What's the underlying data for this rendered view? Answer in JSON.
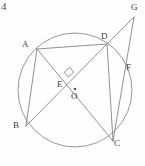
{
  "figure": {
    "number_label": "4",
    "caption": "",
    "stroke_color": "#777777",
    "label_color": "#3a3a3a",
    "background_color": "#fefefe"
  },
  "diagram": {
    "type": "circle-geometry",
    "circle": {
      "name": "circumscribed-circle",
      "center_label": "O",
      "center": {
        "x": 75,
        "y": 90
      },
      "radius": 57
    },
    "points": [
      {
        "id": "A",
        "label": "A",
        "x": 37,
        "y": 49,
        "on_circle": true
      },
      {
        "id": "B",
        "label": "B",
        "x": 26,
        "y": 126,
        "on_circle": true
      },
      {
        "id": "C",
        "label": "C",
        "x": 113,
        "y": 141,
        "on_circle": true
      },
      {
        "id": "D",
        "label": "D",
        "x": 107,
        "y": 44,
        "on_circle": true
      },
      {
        "id": "E",
        "label": "E",
        "x": 68,
        "y": 78,
        "on_circle": false
      },
      {
        "id": "F",
        "label": "F",
        "x": 125,
        "y": 71,
        "on_circle": true
      },
      {
        "id": "G",
        "label": "G",
        "x": 134,
        "y": 17,
        "on_circle": false
      },
      {
        "id": "O",
        "label": "O",
        "x": 75,
        "y": 89,
        "on_circle": false
      }
    ],
    "segments": [
      {
        "id": "AB",
        "from": "A",
        "to": "B",
        "name": "chord-ab"
      },
      {
        "id": "AD",
        "from": "A",
        "to": "D",
        "name": "chord-ad"
      },
      {
        "id": "AC",
        "from": "A",
        "to": "C",
        "name": "diagonal-ac"
      },
      {
        "id": "BD",
        "from": "B",
        "to": "D",
        "name": "diagonal-bd"
      },
      {
        "id": "BC",
        "from": "B",
        "to": "C",
        "name": "arc-side-bc"
      },
      {
        "id": "DC",
        "from": "D",
        "to": "C",
        "name": "chord-dc"
      },
      {
        "id": "DG",
        "from": "D",
        "to": "G",
        "name": "tangent-segment-dg"
      },
      {
        "id": "GC",
        "from": "G",
        "to": "C",
        "name": "secant-gc-through-f"
      }
    ],
    "right_angle": {
      "at": "E",
      "name": "right-angle-marker-at-e",
      "between": [
        "AC",
        "BD"
      ],
      "size": 8
    },
    "center_dot": {
      "at": "O",
      "radius": 1.2
    }
  }
}
